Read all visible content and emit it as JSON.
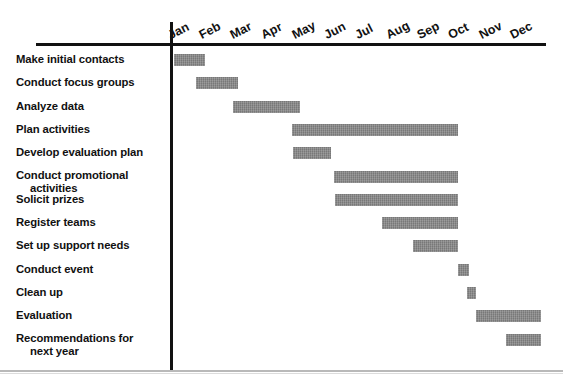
{
  "chart_data": {
    "type": "bar",
    "chart_kind": "gantt",
    "title": "",
    "xlabel": "",
    "ylabel": "",
    "grid": false,
    "legend": null,
    "axis": {
      "months": [
        "Jan",
        "Feb",
        "Mar",
        "Apr",
        "May",
        "Jun",
        "Jul",
        "Aug",
        "Sep",
        "Oct",
        "Nov",
        "Dec"
      ],
      "xlim": [
        0,
        12
      ],
      "tick_rotation_degrees": -27
    },
    "bar_color": "#888888",
    "axis_color": "#111111",
    "categories": [
      "Make initial contacts",
      "Conduct focus groups",
      "Analyze data",
      "Plan activities",
      "Develop evaluation plan",
      "Conduct promotional activities",
      "Solicit prizes",
      "Register teams",
      "Set up support needs",
      "Conduct event",
      "Clean up",
      "Evaluation",
      "Recommendations for next year"
    ],
    "tasks": [
      {
        "label_line1": "Make initial contacts",
        "label_line2": "",
        "start_month": 0.05,
        "end_month": 1.05,
        "start_label": "Jan",
        "end_label": "Jan"
      },
      {
        "label_line1": "Conduct focus groups",
        "label_line2": "",
        "start_month": 0.78,
        "end_month": 2.12,
        "start_label": "Feb",
        "end_label": "Feb"
      },
      {
        "label_line1": "Analyze data",
        "label_line2": "",
        "start_month": 1.97,
        "end_month": 4.12,
        "start_label": "Mar",
        "end_label": "Apr"
      },
      {
        "label_line1": "Plan activities",
        "label_line2": "",
        "start_month": 3.86,
        "end_month": 9.2,
        "start_label": "May",
        "end_label": "Sep"
      },
      {
        "label_line1": "Develop evaluation plan",
        "label_line2": "",
        "start_month": 3.9,
        "end_month": 5.1,
        "start_label": "May",
        "end_label": "May"
      },
      {
        "label_line1": "Conduct promotional",
        "label_line2": "activities",
        "start_month": 5.2,
        "end_month": 9.2,
        "start_label": "Jun",
        "end_label": "Sep"
      },
      {
        "label_line1": "Solicit prizes",
        "label_line2": "",
        "start_month": 5.25,
        "end_month": 9.2,
        "start_label": "Jun",
        "end_label": "Sep"
      },
      {
        "label_line1": "Register teams",
        "label_line2": "",
        "start_month": 6.75,
        "end_month": 9.2,
        "start_label": "Aug",
        "end_label": "Sep"
      },
      {
        "label_line1": "Set up support needs",
        "label_line2": "",
        "start_month": 7.75,
        "end_month": 9.2,
        "start_label": "Sep",
        "end_label": "Sep"
      },
      {
        "label_line1": "Conduct event",
        "label_line2": "",
        "start_month": 9.2,
        "end_month": 9.55,
        "start_label": "Oct",
        "end_label": "Oct"
      },
      {
        "label_line1": "Clean up",
        "label_line2": "",
        "start_month": 9.5,
        "end_month": 9.78,
        "start_label": "Oct",
        "end_label": "Oct"
      },
      {
        "label_line1": "Evaluation",
        "label_line2": "",
        "start_month": 9.78,
        "end_month": 11.88,
        "start_label": "Nov",
        "end_label": "Dec"
      },
      {
        "label_line1": "Recommendations for",
        "label_line2": "next year",
        "start_month": 10.75,
        "end_month": 11.85,
        "start_label": "Dec",
        "end_label": "Dec"
      }
    ]
  }
}
